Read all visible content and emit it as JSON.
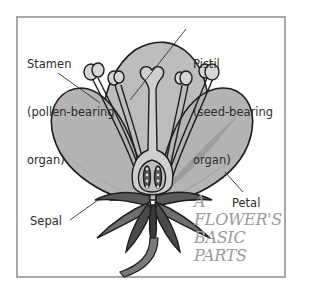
{
  "title": {
    "lines": [
      "A",
      "FLOWER'S",
      "BASIC",
      "PARTS"
    ],
    "color": "#9a9a9a"
  },
  "labels": {
    "stamen": {
      "line1": "Stamen",
      "line2": "(pollen-bearing",
      "line3": "organ)"
    },
    "pistil": {
      "line1": "Pistil",
      "line2": "(seed-bearing",
      "line3": "organ)"
    },
    "petal": "Petal",
    "sepal": "Sepal"
  },
  "colors": {
    "frame_border": "#a8a8a8",
    "petal_fill": "#b4b4b4",
    "petal_stripe": "#9c9c9c",
    "sepal_fill": "#6e6e6e",
    "sepal_dark": "#4a4a4a",
    "outline": "#1e1e1e",
    "stamen_fill": "#d6d6d6"
  }
}
